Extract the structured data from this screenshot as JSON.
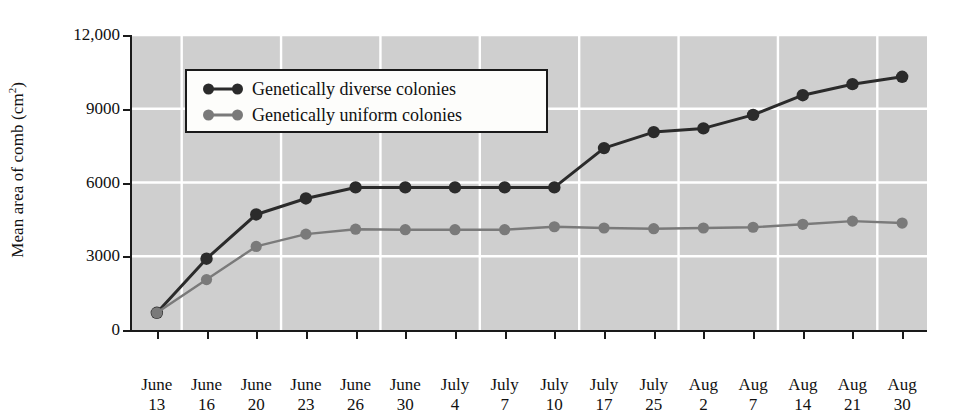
{
  "chart_data": {
    "type": "line",
    "title": "",
    "xlabel": "",
    "ylabel": "Mean area of comb (cm2)",
    "ylabel_main": "Mean area of comb (cm",
    "ylabel_sup": "2",
    "ylabel_tail": ")",
    "ylim": [
      0,
      12000
    ],
    "yticks": [
      0,
      3000,
      6000,
      9000,
      12000
    ],
    "ytick_labels": [
      "0",
      "3000",
      "6000",
      "9000",
      "12,000"
    ],
    "grid": true,
    "legend_position": "upper-left-inside",
    "categories": [
      "June 13",
      "June 16",
      "June 20",
      "June 23",
      "June 26",
      "June 30",
      "July 4",
      "July 7",
      "July 10",
      "July 17",
      "July 25",
      "Aug 2",
      "Aug 7",
      "Aug 14",
      "Aug 21",
      "Aug 30"
    ],
    "x_tick_months": [
      "June",
      "June",
      "June",
      "June",
      "June",
      "June",
      "July",
      "July",
      "July",
      "July",
      "July",
      "Aug",
      "Aug",
      "Aug",
      "Aug",
      "Aug"
    ],
    "x_tick_days": [
      "13",
      "16",
      "20",
      "23",
      "26",
      "30",
      "4",
      "7",
      "10",
      "17",
      "25",
      "2",
      "7",
      "14",
      "21",
      "30"
    ],
    "series": [
      {
        "name": "Genetically diverse colonies",
        "color": "#2b2b2b",
        "values": [
          700,
          2900,
          4700,
          5350,
          5800,
          5800,
          5800,
          5800,
          5800,
          7400,
          8050,
          8200,
          8750,
          9550,
          10000,
          10300
        ]
      },
      {
        "name": "Genetically uniform colonies",
        "color": "#7a7a7a",
        "values": [
          700,
          2050,
          3400,
          3900,
          4100,
          4080,
          4080,
          4080,
          4200,
          4150,
          4120,
          4150,
          4180,
          4300,
          4430,
          4350
        ]
      }
    ]
  },
  "legend": {
    "items": [
      {
        "label": "Genetically diverse colonies",
        "color": "#2b2b2b"
      },
      {
        "label": "Genetically uniform colonies",
        "color": "#7a7a7a"
      }
    ]
  },
  "style": {
    "plot_background": "#cfcfcf",
    "grid_color": "#ffffff",
    "axis_color": "#1a1a1a",
    "page_background": "#ffffff"
  }
}
